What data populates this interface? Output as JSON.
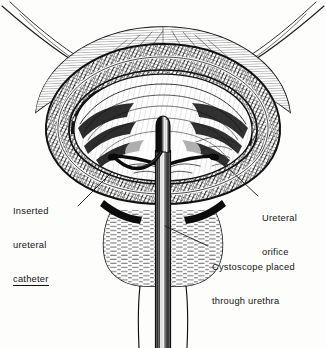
{
  "figure": {
    "style": "pen-and-ink cross-hatched medical illustration",
    "background_color": "#fdfdfc",
    "ink_color": "#101010",
    "width": 326,
    "height": 348
  },
  "labels": {
    "inserted_ureteral_catheter": {
      "line1": "Inserted",
      "line2": "ureteral",
      "line3": "catheter",
      "underlined_line": "catheter",
      "position": "left"
    },
    "ureteral_orifice": {
      "line1": "Ureteral",
      "line2": "orifice",
      "position": "right"
    },
    "cystoscope_through_urethra": {
      "line1": "Cystoscope placed",
      "line2": "through urethra",
      "position": "bottom-right"
    }
  },
  "anatomy": {
    "bladder_dome": "bladder dome",
    "bladder_wall": "cross-hatched bladder wall",
    "bladder_cavity": "bladder cavity interior",
    "trigone": "trigone",
    "prostate": "prostate",
    "urethra": "urethra"
  },
  "instruments": {
    "cystoscope": "cystoscope",
    "cystoscope_shaft": "cystoscope shaft",
    "cystoscope_tip": "cystoscope tip",
    "ureteral_catheter": "ureteral catheter"
  }
}
